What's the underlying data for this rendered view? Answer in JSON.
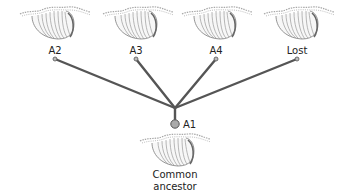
{
  "descendants": [
    {
      "id": "a2",
      "label": "A2",
      "x": 55,
      "label_y": 45,
      "endpoint": [
        55,
        59
      ],
      "skel_x": 18
    },
    {
      "id": "a3",
      "label": "A3",
      "x": 136,
      "label_y": 45,
      "endpoint": [
        136,
        59
      ],
      "skel_x": 101
    },
    {
      "id": "a4",
      "label": "A4",
      "x": 216,
      "label_y": 45,
      "endpoint": [
        216,
        59
      ],
      "skel_x": 180
    },
    {
      "id": "lost",
      "label": "Lost",
      "x": 297,
      "label_y": 45,
      "endpoint": [
        297,
        59
      ],
      "skel_x": 262
    }
  ],
  "root": {
    "node_label": "A1",
    "ancestor_label_line1": "Common",
    "ancestor_label_line2": "ancestor",
    "node": [
      175,
      124
    ],
    "junction": [
      175,
      108
    ]
  },
  "colors": {
    "branch": "#555555",
    "node_fill": "#aaaaaa",
    "node_stroke": "#555555",
    "skeleton_stroke": "#9a9a9a",
    "text": "#222222"
  }
}
